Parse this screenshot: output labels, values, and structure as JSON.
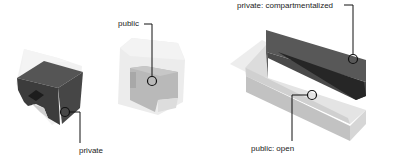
{
  "diagram": {
    "type": "architectural massing diagram",
    "colors": {
      "background": "#ffffff",
      "private_dark": "#3a3a3a",
      "private_mid": "#505050",
      "public_light": "#e6e6e6",
      "public_mid": "#b5b5b5",
      "translucent_shell": "#eeeeee",
      "leader_line": "#111111"
    },
    "models": [
      {
        "id": "model-1",
        "description": "dark solid volume inside translucent shell",
        "annotations": [
          {
            "label": "private"
          }
        ]
      },
      {
        "id": "model-2",
        "description": "grey volume inside translucent shell",
        "annotations": [
          {
            "label": "public"
          }
        ]
      },
      {
        "id": "model-3",
        "description": "elongated bar split into dark and light halves",
        "annotations": [
          {
            "label": "private: compartmentalized"
          },
          {
            "label": "public: open"
          }
        ]
      }
    ]
  }
}
